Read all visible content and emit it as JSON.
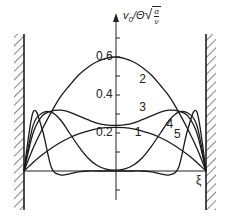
{
  "chart_data": {
    "type": "line",
    "title": "",
    "xlabel": "ξ",
    "ylabel": "v0/Θ√(α/ν)",
    "ylabel_parts": {
      "main": "v",
      "sub": "0",
      "rest": "/Θ",
      "frac_num": "α",
      "frac_den": "ν"
    },
    "xlim": [
      -1,
      1
    ],
    "ylim": [
      -0.15,
      0.75
    ],
    "y_ticks": [
      -0.1,
      0.1,
      0.2,
      0.3,
      0.4,
      0.5,
      0.6,
      0.7
    ],
    "y_tick_labels": [
      "0.2",
      "0.4",
      "0.6"
    ],
    "y_tick_label_values": [
      0.2,
      0.4,
      0.6
    ],
    "grid": false,
    "walls": [
      "left",
      "right"
    ],
    "x": [
      -1.0,
      -0.9,
      -0.8,
      -0.7,
      -0.6,
      -0.5,
      -0.4,
      -0.3,
      -0.2,
      -0.1,
      0.0,
      0.1,
      0.2,
      0.3,
      0.4,
      0.5,
      0.6,
      0.7,
      0.8,
      0.9,
      1.0
    ],
    "series": [
      {
        "name": "1",
        "label": "1",
        "values": [
          0.0,
          0.045,
          0.085,
          0.12,
          0.15,
          0.175,
          0.195,
          0.21,
          0.222,
          0.228,
          0.23,
          0.228,
          0.222,
          0.21,
          0.195,
          0.175,
          0.15,
          0.12,
          0.085,
          0.045,
          0.0
        ]
      },
      {
        "name": "2",
        "label": "2",
        "values": [
          0.0,
          0.12,
          0.22,
          0.31,
          0.39,
          0.45,
          0.505,
          0.545,
          0.575,
          0.593,
          0.6,
          0.593,
          0.575,
          0.545,
          0.505,
          0.45,
          0.39,
          0.31,
          0.22,
          0.12,
          0.0
        ]
      },
      {
        "name": "3",
        "label": "3",
        "values": [
          0.0,
          0.2,
          0.29,
          0.315,
          0.32,
          0.31,
          0.29,
          0.27,
          0.252,
          0.243,
          0.24,
          0.243,
          0.252,
          0.27,
          0.29,
          0.31,
          0.32,
          0.315,
          0.29,
          0.2,
          0.0
        ]
      },
      {
        "name": "4",
        "label": "4",
        "values": [
          0.0,
          0.24,
          0.305,
          0.31,
          0.27,
          0.2,
          0.13,
          0.07,
          0.03,
          0.01,
          0.005,
          0.01,
          0.03,
          0.07,
          0.13,
          0.2,
          0.27,
          0.31,
          0.305,
          0.24,
          0.0
        ]
      },
      {
        "name": "5",
        "label": "5",
        "values": [
          0.0,
          0.31,
          0.22,
          0.02,
          -0.02,
          -0.015,
          -0.005,
          0.0,
          0.0,
          0.0,
          0.0,
          0.0,
          0.0,
          0.0,
          -0.005,
          -0.015,
          -0.02,
          0.02,
          0.22,
          0.31,
          0.0
        ]
      }
    ],
    "annotations": [
      {
        "text": "1",
        "x": 0.25,
        "y": 0.2
      },
      {
        "text": "2",
        "x": 0.3,
        "y": 0.48
      },
      {
        "text": "3",
        "x": 0.3,
        "y": 0.33
      },
      {
        "text": "4",
        "x": 0.6,
        "y": 0.24
      },
      {
        "text": "5",
        "x": 0.68,
        "y": 0.19
      }
    ],
    "legend": "none (curves labeled inline)"
  }
}
